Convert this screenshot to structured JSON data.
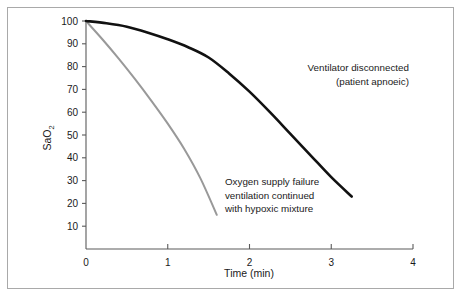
{
  "chart_data": {
    "type": "line",
    "title": "",
    "subtitle": "",
    "xlabel": "Time (min)",
    "ylabel": "SaO2",
    "ylabel_display": "SaO",
    "ylabel_subscript": "2",
    "xlim": [
      0,
      4
    ],
    "ylim": [
      0,
      100
    ],
    "xticks": [
      0,
      1,
      2,
      3,
      4
    ],
    "xtick_labels": [
      "0",
      "1",
      "2",
      "3",
      "4"
    ],
    "yticks": [
      10,
      20,
      30,
      40,
      50,
      60,
      70,
      80,
      90,
      100
    ],
    "ytick_labels": [
      "10",
      "20",
      "30",
      "40",
      "50",
      "60",
      "70",
      "80",
      "90",
      "100"
    ],
    "grid": false,
    "legend_position": "none",
    "series": [
      {
        "name": "Ventilator disconnected (patient apnoeic)",
        "color": "#111111",
        "x": [
          0.0,
          0.25,
          0.5,
          0.75,
          1.0,
          1.25,
          1.5,
          1.75,
          2.0,
          2.25,
          2.5,
          2.75,
          3.0,
          3.25
        ],
        "y": [
          100,
          99,
          97.5,
          95,
          92,
          88.5,
          84,
          77,
          69,
          60,
          50.5,
          41,
          31.5,
          23
        ]
      },
      {
        "name": "Oxygen supply failure ventilation continued with hypoxic mixture",
        "color": "#999999",
        "x": [
          0.0,
          0.2,
          0.4,
          0.6,
          0.8,
          1.0,
          1.2,
          1.4,
          1.6
        ],
        "y": [
          100,
          92,
          83.5,
          74.5,
          65,
          55,
          44,
          31,
          15
        ]
      }
    ],
    "annotations": [
      {
        "id": "annotation-ventilator",
        "align": "right",
        "lines": [
          "Ventilator disconnected",
          "(patient apnoeic)"
        ],
        "x": 3.95,
        "y": 78
      },
      {
        "id": "annotation-oxygen-failure",
        "align": "left",
        "lines": [
          "Oxygen supply failure",
          "ventilation continued",
          "with hypoxic mixture"
        ],
        "x": 1.7,
        "y": 28
      }
    ],
    "colors": {
      "axis": "#5a5a5a",
      "frame": "#a9a9a9",
      "text": "#1a1a1a",
      "series_black": "#111111",
      "series_grey": "#999999",
      "background": "#ffffff"
    }
  }
}
